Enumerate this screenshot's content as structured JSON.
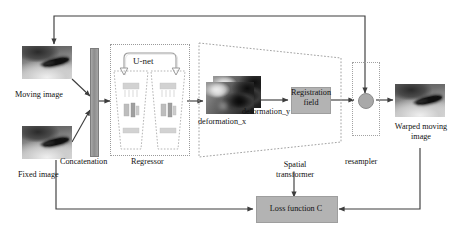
{
  "diagram": {
    "nodes": {
      "moving_image": "Moving image",
      "fixed_image": "Fixed image",
      "concatenation": "Concatenation",
      "regressor": "Regressor",
      "unet": "U-net",
      "deformation_x": "deformation_x",
      "deformation_y": "deformation_y",
      "registration_field": "Registration\nfield",
      "registration_field_line1": "Registration",
      "registration_field_line2": "field",
      "spatial_transformer_line1": "Spatial",
      "spatial_transformer_line2": "transformer",
      "resampler": "resampler",
      "warped_line1": "Warped moving",
      "warped_line2": "image",
      "loss_function": "Loss function C"
    },
    "colors": {
      "wire": "#3d3d3d",
      "dashed_border": "#9a9a9a",
      "gray_block": "#b3b3b3",
      "concat_bar": "#9a9a9a",
      "node_circle": "#a9a9a9",
      "text": "#111111",
      "background": "#ffffff"
    },
    "edges": [
      {
        "from": "moving_image",
        "to": "concatenation"
      },
      {
        "from": "fixed_image",
        "to": "concatenation"
      },
      {
        "from": "concatenation",
        "to": "regressor"
      },
      {
        "from": "regressor",
        "to": "deformation_x"
      },
      {
        "from": "deformation_x",
        "to": "registration_field"
      },
      {
        "from": "registration_field",
        "to": "resampler"
      },
      {
        "from": "moving_image_top",
        "to": "resampler_top"
      },
      {
        "from": "resampler",
        "to": "warped_moving_image"
      },
      {
        "from": "fixed_image",
        "to": "loss_function"
      },
      {
        "from": "spatial_transformer",
        "to": "loss_function"
      },
      {
        "from": "warped_moving_image",
        "to": "loss_function"
      }
    ]
  }
}
